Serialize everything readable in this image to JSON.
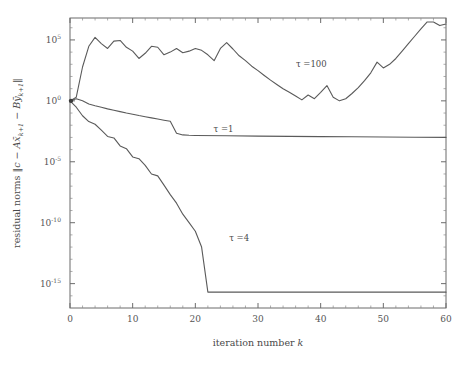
{
  "chart_data": {
    "type": "line",
    "title": "",
    "xlabel": "iteration number k",
    "ylabel": "residual norms ‖c − A x̄ₖ₊₁ − B ȳₖ₊₁‖",
    "ylabel_parts": {
      "prefix": "residual norms ",
      "norm_open": "‖",
      "c": "c",
      "minus1": " − ",
      "A": "A",
      "xbar": "x̄",
      "xsub": "k+1",
      "minus2": " − ",
      "B": "B",
      "ybar": "ȳ",
      "ysub": "k+1",
      "norm_close": "‖"
    },
    "xscale": "linear",
    "yscale": "log",
    "xlim": [
      0,
      60
    ],
    "ylim": [
      1e-17,
      6300000.0
    ],
    "grid": false,
    "legend": "inline-annotations",
    "xticks": [
      0,
      10,
      20,
      30,
      40,
      50,
      60
    ],
    "xtick_labels": [
      "0",
      "10",
      "20",
      "30",
      "40",
      "50",
      "60"
    ],
    "yticks": [
      100000,
      1,
      1e-05,
      1e-10,
      1e-15
    ],
    "ytick_labels": [
      "10^5",
      "10^0",
      "10^-5",
      "10^-10",
      "10^-15"
    ],
    "ytick_mantissa": "10",
    "ytick_exponents": [
      "5",
      "0",
      "-5",
      "-10",
      "-15"
    ],
    "series": [
      {
        "name": "tau=100",
        "label": "τ =100",
        "label_x": 38.5,
        "label_y": 600.0,
        "x": [
          0,
          1,
          2,
          3,
          4,
          5,
          6,
          7,
          8,
          9,
          10,
          11,
          12,
          13,
          14,
          15,
          16,
          17,
          18,
          19,
          20,
          21,
          22,
          23,
          24,
          25,
          26,
          27,
          28,
          29,
          30,
          31,
          32,
          33,
          34,
          35,
          36,
          37,
          38,
          39,
          40,
          41,
          42,
          43,
          44,
          45,
          46,
          47,
          48,
          49,
          50,
          51,
          52,
          53,
          54,
          55,
          56,
          57,
          58,
          59,
          60
        ],
        "y": [
          1.0,
          2.0,
          600.0,
          30000.0,
          160000.0,
          50000.0,
          20000.0,
          80000.0,
          90000.0,
          25000.0,
          12000.0,
          3000.0,
          8000.0,
          30000.0,
          25000.0,
          6000.0,
          10000.0,
          20000.0,
          9000.0,
          12000.0,
          20000.0,
          14000.0,
          6000.0,
          2000.0,
          20000.0,
          60000.0,
          18000.0,
          5000.0,
          2000.0,
          700.0,
          300.0,
          120.0,
          50.0,
          22.0,
          10.0,
          5.0,
          2.5,
          1.2,
          3.0,
          1.5,
          5.0,
          18.0,
          2.0,
          1.0,
          1.5,
          4.0,
          12.0,
          45.0,
          200.0,
          1500.0,
          500.0,
          1000.0,
          3000.0,
          12000.0,
          50000.0,
          200000.0,
          800000.0,
          3000000.0,
          3000000.0,
          1500000.0,
          2000000.0
        ]
      },
      {
        "name": "tau=1",
        "label": "τ =1",
        "label_x": 24.5,
        "label_y": 0.003,
        "x": [
          0,
          1,
          2,
          3,
          4,
          5,
          6,
          7,
          8,
          9,
          10,
          11,
          12,
          13,
          14,
          15,
          16,
          17,
          18,
          19,
          20,
          25,
          30,
          35,
          40,
          45,
          50,
          55,
          60
        ],
        "y": [
          1.0,
          1.5,
          1.0,
          0.55,
          0.4,
          0.3,
          0.22,
          0.17,
          0.13,
          0.1,
          0.08,
          0.062,
          0.05,
          0.04,
          0.032,
          0.026,
          0.021,
          0.0022,
          0.0016,
          0.0015,
          0.00145,
          0.00135,
          0.00128,
          0.00122,
          0.00117,
          0.00112,
          0.00108,
          0.00104,
          0.001
        ]
      },
      {
        "name": "tau=4",
        "label": "τ =4",
        "label_x": 27.0,
        "label_y": 3e-12,
        "x": [
          0,
          1,
          2,
          3,
          4,
          5,
          6,
          7,
          8,
          9,
          10,
          11,
          12,
          13,
          14,
          15,
          16,
          17,
          18,
          19,
          20,
          21,
          22,
          23,
          30,
          40,
          50,
          60
        ],
        "y": [
          1.0,
          0.3,
          0.06,
          0.02,
          0.012,
          0.004,
          0.0012,
          0.0009,
          0.0002,
          0.00012,
          2.5e-05,
          1.8e-05,
          5e-06,
          1e-06,
          7e-07,
          1.2e-07,
          2e-08,
          4e-09,
          5e-10,
          1e-10,
          2e-11,
          1e-12,
          2e-16,
          2e-16,
          2e-16,
          2e-16,
          2e-16,
          2e-16
        ]
      }
    ],
    "origin_marker": {
      "x": 0,
      "y": 1.0
    }
  },
  "colors": {
    "line": "#5a5a5a",
    "axis": "#6b6b6b",
    "text": "#4a4a4a",
    "background": "#ffffff"
  }
}
